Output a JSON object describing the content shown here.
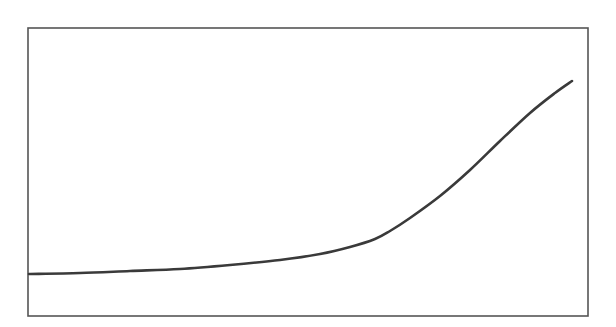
{
  "chart_data": {
    "type": "line",
    "title": "",
    "xlabel": "",
    "ylabel": "",
    "grid": false,
    "legend": null,
    "frame": {
      "x0": 28,
      "y0": 28,
      "x1": 588,
      "y1": 316,
      "color": "#555555"
    },
    "series": [
      {
        "name": "curve",
        "color": "#3a3a3a",
        "pixel_points": [
          [
            29,
            274
          ],
          [
            80,
            273
          ],
          [
            130,
            271
          ],
          [
            180,
            269
          ],
          [
            230,
            265
          ],
          [
            280,
            260
          ],
          [
            320,
            254
          ],
          [
            350,
            247
          ],
          [
            375,
            239
          ],
          [
            390,
            231
          ],
          [
            410,
            218
          ],
          [
            440,
            196
          ],
          [
            470,
            170
          ],
          [
            500,
            141
          ],
          [
            530,
            113
          ],
          [
            555,
            93
          ],
          [
            572,
            81
          ]
        ]
      }
    ]
  }
}
